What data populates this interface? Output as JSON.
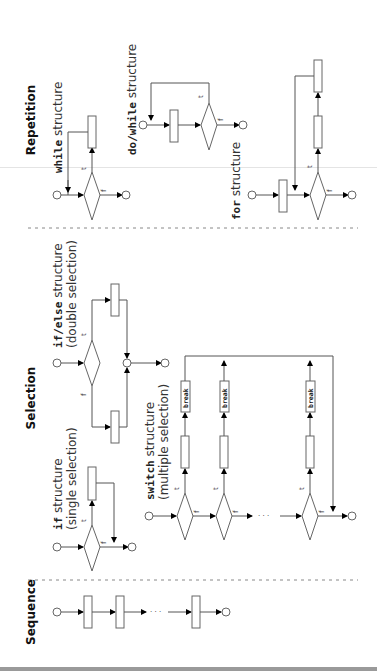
{
  "sections": {
    "repetition": "Repetition",
    "selection": "Selection",
    "sequence": "Sequence"
  },
  "captions": {
    "while": {
      "keyword": "while",
      "text": " structure"
    },
    "do_while": {
      "keyword": "do/while",
      "text": " structure"
    },
    "for": {
      "keyword": "for",
      "text": " structure"
    },
    "if_else": {
      "keyword": "if/else",
      "text": " structure",
      "sub": "(double selection)"
    },
    "if": {
      "keyword": "if",
      "text": " structure",
      "sub": "(single selection)"
    },
    "switch": {
      "keyword": "switch",
      "text": " structure",
      "sub": "(multiple selection)"
    }
  },
  "labels": {
    "true": "t",
    "false": "f",
    "break": "break",
    "ellipsis": "· · ·"
  },
  "colors": {
    "line": "#555555",
    "arrow": "#000000",
    "divider": "#888888"
  }
}
